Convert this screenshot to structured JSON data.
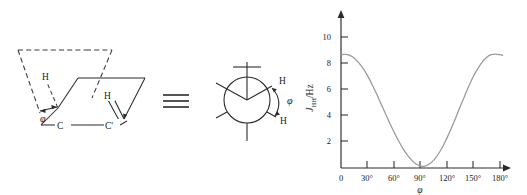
{
  "figure": {
    "kind": "karplus-dihedral-figure",
    "equivalence_symbol": "≡"
  },
  "sawhorse": {
    "name": "sawhorse-projection",
    "atom_labels": {
      "carbon_front": "C",
      "carbon_back": "C'",
      "hydrogen_front": "H",
      "hydrogen_back": "H"
    },
    "angle_label": "φ"
  },
  "newman": {
    "name": "newman-projection",
    "atom_labels": {
      "hydrogen_upper": "H",
      "hydrogen_lower": "H"
    },
    "angle_label": "φ"
  },
  "chart_data": {
    "type": "line",
    "title": "",
    "xlabel": "φ",
    "ylabel": "Jₕₕ/Hz",
    "ylabel_main": "J",
    "ylabel_sub": "HH",
    "ylabel_unit": "/Hz",
    "xlim": [
      0,
      190
    ],
    "ylim": [
      0,
      11.5
    ],
    "grid": false,
    "legend": null,
    "xticks": [
      0,
      30,
      60,
      90,
      120,
      150,
      180
    ],
    "xtick_labels": [
      "0",
      "30°",
      "60°",
      "90°",
      "120°",
      "150°",
      "180°"
    ],
    "yticks": [
      2,
      4,
      6,
      8,
      10
    ],
    "ytick_labels": [
      "2",
      "4",
      "6",
      "8",
      "10"
    ],
    "series_name": "Karplus curve",
    "series_color": "#999999",
    "x": [
      0,
      5,
      10,
      15,
      20,
      25,
      30,
      35,
      40,
      45,
      50,
      55,
      60,
      65,
      70,
      75,
      80,
      85,
      90,
      95,
      100,
      105,
      110,
      115,
      120,
      125,
      130,
      135,
      140,
      145,
      150,
      155,
      160,
      165,
      170,
      175,
      180,
      183
    ],
    "y": [
      8.65,
      8.68,
      8.6,
      8.4,
      8.05,
      7.6,
      7.05,
      6.4,
      5.7,
      4.95,
      4.2,
      3.45,
      2.75,
      2.1,
      1.5,
      1.0,
      0.6,
      0.3,
      0.15,
      0.15,
      0.3,
      0.6,
      1.05,
      1.6,
      2.3,
      3.05,
      3.85,
      4.7,
      5.5,
      6.3,
      7.0,
      7.6,
      8.1,
      8.45,
      8.65,
      8.7,
      8.65,
      8.6
    ]
  }
}
